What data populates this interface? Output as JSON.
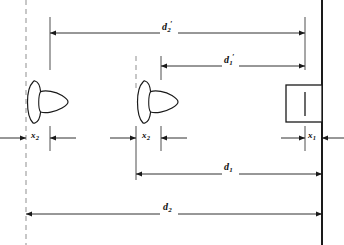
{
  "figure": {
    "background_color": "#ffffff",
    "line_color": "#1a1a1a",
    "dashed_color": "#8a8a8a",
    "labels": [
      {
        "id": "d2-prime",
        "base": "d",
        "prime": "′",
        "sub": "2",
        "x": 168,
        "y": 27,
        "kind": "distance"
      },
      {
        "id": "d1-prime",
        "base": "d",
        "prime": "′",
        "sub": "1",
        "x": 229,
        "y": 60,
        "kind": "distance"
      },
      {
        "id": "x2-left",
        "base": "x",
        "prime": "",
        "sub": "2",
        "x": 35,
        "y": 137,
        "kind": "offset"
      },
      {
        "id": "x2-mid",
        "base": "x",
        "prime": "",
        "sub": "2",
        "x": 146,
        "y": 137,
        "kind": "offset"
      },
      {
        "id": "x1-right",
        "base": "x",
        "prime": "",
        "sub": "1",
        "x": 311,
        "y": 137,
        "kind": "offset"
      },
      {
        "id": "d1",
        "base": "d",
        "prime": "",
        "sub": "1",
        "x": 229,
        "y": 168,
        "kind": "distance"
      },
      {
        "id": "d2",
        "base": "d",
        "prime": "",
        "sub": "2",
        "x": 168,
        "y": 208,
        "kind": "distance"
      }
    ],
    "elements": {
      "lens_far": {
        "name": "lens-far",
        "x": 26,
        "y": 102
      },
      "lens_near": {
        "name": "lens-near",
        "x": 136,
        "y": 102
      },
      "image_block": {
        "name": "image-block",
        "x": 286,
        "y": 85,
        "width": 36,
        "height": 37
      },
      "screen_plane": {
        "name": "screen-plane",
        "x": 322
      }
    },
    "reference_lines": {
      "dashed_left": {
        "x": 26,
        "y1": 0,
        "y2": 245
      },
      "dashed_mid": {
        "x": 136,
        "y1": 57,
        "y2": 90
      },
      "tick_left": {
        "x": 50,
        "y1": 18,
        "y2": 70
      },
      "tick_mid": {
        "x": 161,
        "y1": 57,
        "y2": 80
      },
      "tick_right": {
        "x": 305,
        "y1": 18,
        "y2": 70
      }
    }
  }
}
